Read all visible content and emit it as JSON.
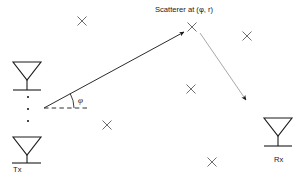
{
  "diagram": {
    "background_color": "#ffffff",
    "stroke_color": "#1a1a1a",
    "scatterer_color": "#6e6e6e",
    "ray_in_color": "#2b2b2b",
    "ray_out_color": "#9a9a9a",
    "labels": {
      "scatterer": "Scatterer at (φ, r)",
      "tx": "Tx",
      "rx": "Rx",
      "angle": "φ"
    },
    "nodes": {
      "tx_array": {
        "name": "Tx",
        "element_count_shown": 2,
        "ellipsis_dots": 3,
        "antennas": [
          {
            "cx": 27,
            "cy": 72
          },
          {
            "cx": 27,
            "cy": 147
          }
        ],
        "dots": [
          {
            "cx": 28,
            "cy": 97
          },
          {
            "cx": 28,
            "cy": 109
          },
          {
            "cx": 28,
            "cy": 121
          }
        ]
      },
      "rx_antenna": {
        "name": "Rx",
        "cx": 277,
        "cy": 128
      },
      "active_scatterer": {
        "cx": 192,
        "cy": 27
      }
    },
    "rays": [
      {
        "name": "tx-to-scatterer",
        "from": {
          "x": 44,
          "y": 108
        },
        "to": {
          "x": 188,
          "y": 30
        },
        "arrowhead": "filled",
        "style": "solid"
      },
      {
        "name": "scatterer-to-rx",
        "from": {
          "x": 199,
          "y": 32
        },
        "to": {
          "x": 249,
          "y": 104
        },
        "arrowhead": "filled",
        "style": "solid-light"
      }
    ],
    "angle_marker": {
      "vertex": {
        "x": 44,
        "y": 108
      },
      "reference_line": {
        "x1": 44,
        "y1": 108,
        "x2": 86,
        "y2": 108,
        "style": "dashed"
      },
      "arc_radius": 30,
      "symbol": "φ"
    },
    "scatterers": [
      {
        "cx": 82,
        "cy": 21
      },
      {
        "cx": 247,
        "cy": 36
      },
      {
        "cx": 191,
        "cy": 89
      },
      {
        "cx": 107,
        "cy": 125
      },
      {
        "cx": 212,
        "cy": 162
      },
      {
        "cx": 192,
        "cy": 27
      }
    ]
  }
}
